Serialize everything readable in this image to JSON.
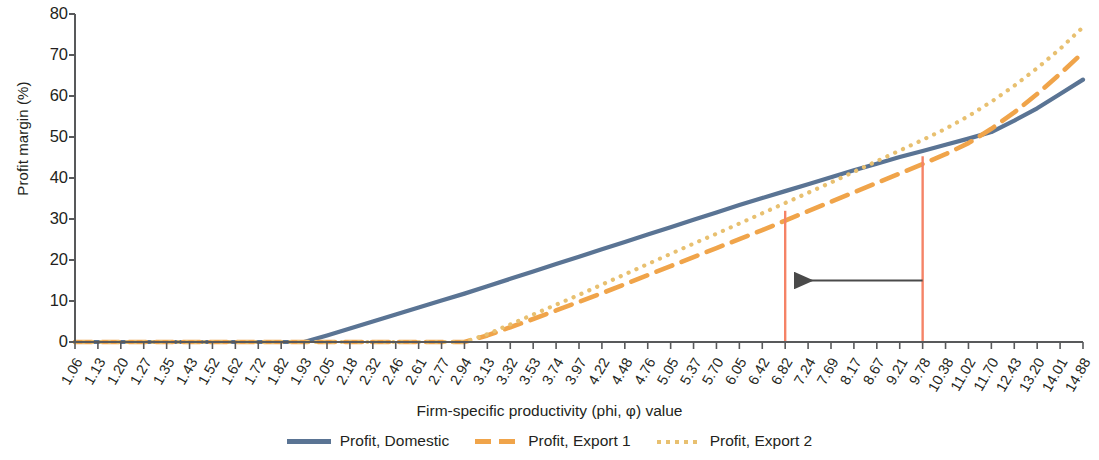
{
  "chart_data": {
    "type": "line",
    "title": "",
    "xlabel": "Firm-specific productivity (phi, φ) value",
    "ylabel": "Profit margin (%)",
    "ylim": [
      0,
      80
    ],
    "yticks": [
      0,
      10,
      20,
      30,
      40,
      50,
      60,
      70,
      80
    ],
    "grid": false,
    "legend_position": "bottom-center",
    "categories": [
      "1.06",
      "1.13",
      "1.20",
      "1.27",
      "1.35",
      "1.43",
      "1.52",
      "1.62",
      "1.72",
      "1.82",
      "1.93",
      "2.05",
      "2.18",
      "2.32",
      "2.46",
      "2.61",
      "2.77",
      "2.94",
      "3.13",
      "3.32",
      "3.53",
      "3.74",
      "3.97",
      "4.22",
      "4.48",
      "4.76",
      "5.05",
      "5.37",
      "5.70",
      "6.05",
      "6.42",
      "6.82",
      "7.24",
      "7.69",
      "8.17",
      "8.67",
      "9.21",
      "9.78",
      "10.38",
      "11.02",
      "11.70",
      "12.43",
      "13.20",
      "14.01",
      "14.88"
    ],
    "series": [
      {
        "name": "Profit, Domestic",
        "style": "solid",
        "color": "#5a7494",
        "values": [
          0,
          0,
          0,
          0,
          0,
          0,
          0,
          0,
          0,
          0,
          0,
          1.6,
          3.3,
          5.0,
          6.7,
          8.4,
          10.1,
          11.8,
          13.6,
          15.4,
          17.2,
          19.0,
          20.8,
          22.6,
          24.4,
          26.2,
          28.0,
          29.8,
          31.6,
          33.4,
          35.1,
          36.8,
          38.5,
          40.2,
          41.9,
          43.5,
          45.1,
          46.6,
          48.1,
          49.6,
          51.2,
          54.0,
          57.0,
          60.5,
          64.0
        ]
      },
      {
        "name": "Profit, Export 1",
        "style": "dashed",
        "color": "#f0a44a",
        "values": [
          0,
          0,
          0,
          0,
          0,
          0,
          0,
          0,
          0,
          0,
          0,
          0,
          0,
          0,
          0,
          0,
          0,
          0,
          1.6,
          3.6,
          5.6,
          7.7,
          9.8,
          11.9,
          14.1,
          16.3,
          18.5,
          20.7,
          22.9,
          25.1,
          27.3,
          29.6,
          31.9,
          34.2,
          36.5,
          38.8,
          41.1,
          43.4,
          45.8,
          48.5,
          52.0,
          56.0,
          60.5,
          65.4,
          70.6
        ]
      },
      {
        "name": "Profit, Export 2",
        "style": "dotted",
        "color": "#e8c070",
        "values": [
          0,
          0,
          0,
          0,
          0,
          0,
          0,
          0,
          0,
          0,
          0,
          0,
          0,
          0,
          0,
          0,
          0,
          0,
          1.9,
          4.3,
          6.7,
          9.1,
          11.5,
          14.0,
          16.5,
          19.0,
          21.5,
          24.0,
          26.4,
          28.9,
          31.4,
          33.9,
          36.4,
          38.9,
          41.5,
          44.1,
          46.7,
          49.3,
          52.0,
          55.1,
          58.6,
          62.5,
          66.8,
          71.5,
          76.8
        ]
      }
    ],
    "markers": [
      {
        "name": "left-threshold",
        "x_label": "6.82",
        "x_index": 31,
        "y_top": 32.0,
        "color": "#f58366"
      },
      {
        "name": "right-threshold",
        "x_label": "9.78",
        "x_index": 37,
        "y_top": 45.3,
        "color": "#f58366"
      }
    ],
    "annotations": [
      {
        "name": "leftward-arrow",
        "type": "arrow",
        "direction": "left",
        "from_x_label": "9.78",
        "to_x_label": "6.82",
        "y": 15.0,
        "color": "#4a4a4a"
      }
    ]
  },
  "legend": {
    "items": [
      {
        "label": "Profit, Domestic",
        "swatch": "line-solid-icon"
      },
      {
        "label": "Profit, Export 1",
        "swatch": "line-dashed-icon"
      },
      {
        "label": "Profit, Export 2",
        "swatch": "line-dotted-icon"
      }
    ]
  }
}
